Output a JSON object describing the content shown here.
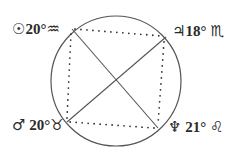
{
  "diagram": {
    "type": "astrological aspect diagram",
    "circle": {
      "cx": 116,
      "cy": 81,
      "r": 65
    },
    "points": [
      {
        "id": "tl",
        "planet": "Sun",
        "planet_glyph": "☉",
        "degree": "20°",
        "sign": "Aquarius",
        "sign_glyph": "♒",
        "x": 72,
        "y": 29
      },
      {
        "id": "tr",
        "planet": "Jupiter",
        "planet_glyph": "♃",
        "degree": "18°",
        "sign": "Scorpio",
        "sign_glyph": "♏",
        "x": 166,
        "y": 37
      },
      {
        "id": "bl",
        "planet": "Mars",
        "planet_glyph": "♂",
        "degree": "20°",
        "sign": "Taurus",
        "sign_glyph": "♉",
        "x": 67,
        "y": 122
      },
      {
        "id": "br",
        "planet": "Neptune",
        "planet_glyph": "♆",
        "degree": "21°",
        "sign": "Leo",
        "sign_glyph": "♌",
        "x": 158,
        "y": 128
      }
    ],
    "solid_lines": [
      [
        "tl",
        "br"
      ],
      [
        "tr",
        "bl"
      ]
    ],
    "dotted_lines": [
      [
        "tl",
        "tr"
      ],
      [
        "tr",
        "br"
      ],
      [
        "br",
        "bl"
      ],
      [
        "bl",
        "tl"
      ]
    ],
    "colors": {
      "stroke": "#444444",
      "text": "#2a2a2a"
    }
  }
}
